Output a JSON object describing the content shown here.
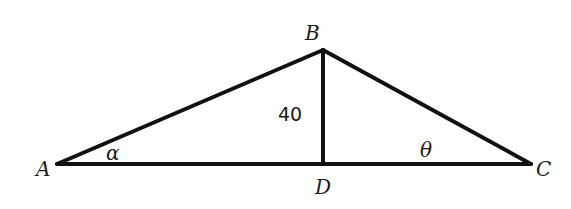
{
  "diagram": {
    "type": "triangle-with-altitude",
    "points": {
      "A": {
        "label": "A",
        "x": 57,
        "y": 164
      },
      "B": {
        "label": "B",
        "x": 323,
        "y": 50
      },
      "C": {
        "label": "C",
        "x": 531,
        "y": 164
      },
      "D": {
        "label": "D",
        "x": 323,
        "y": 164
      }
    },
    "segments": [
      {
        "name": "AB",
        "from": "A",
        "to": "B"
      },
      {
        "name": "BC",
        "from": "B",
        "to": "C"
      },
      {
        "name": "AC",
        "from": "A",
        "to": "C"
      },
      {
        "name": "BD",
        "from": "B",
        "to": "D",
        "length_label": "40"
      }
    ],
    "angles": {
      "alpha": {
        "label": "α",
        "vertex": "A"
      },
      "theta": {
        "label": "θ",
        "vertex": "C"
      }
    },
    "altitude_label": "40"
  }
}
